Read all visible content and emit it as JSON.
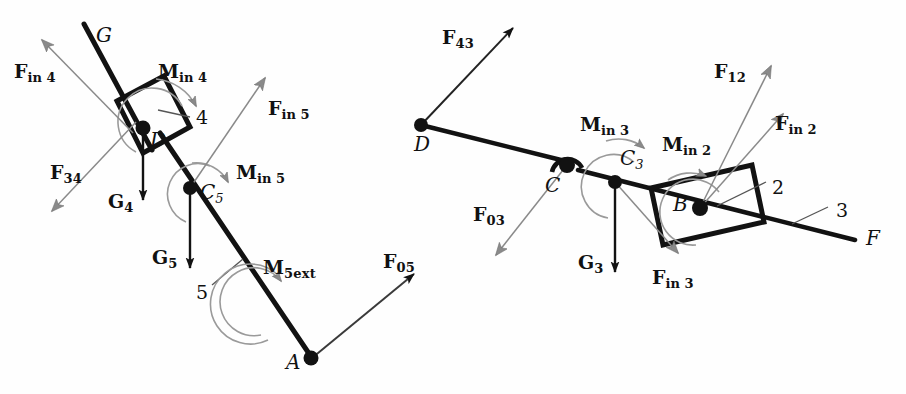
{
  "figure": {
    "type": "free-body-diagram",
    "canvas": {
      "width": 906,
      "height": 394
    },
    "colors": {
      "black": "#121212",
      "gray_arrow": "#878787",
      "thin_line": "#555555",
      "background": "#fefefe"
    }
  },
  "left_group": {
    "joints": [
      {
        "name": "D",
        "label": "D",
        "x": 143,
        "y": 128
      },
      {
        "name": "C5",
        "label": "C",
        "sub": "5",
        "x": 190,
        "y": 188
      },
      {
        "name": "A",
        "label": "A",
        "x": 310,
        "y": 358
      }
    ],
    "link_labels": [
      {
        "name": "link-4",
        "label": "4",
        "x": 196,
        "y": 111
      },
      {
        "name": "link-5",
        "label": "5",
        "x": 198,
        "y": 289
      },
      {
        "name": "axis-G",
        "label": "G",
        "x": 96,
        "y": 31
      }
    ],
    "vectors": [
      {
        "name": "F-in-4",
        "label": "F",
        "sub": "in 4",
        "color": "gray",
        "label_x": 14,
        "label_y": 62
      },
      {
        "name": "F-34",
        "label": "F",
        "sub": "34",
        "color": "gray",
        "label_x": 50,
        "label_y": 168
      },
      {
        "name": "G-4",
        "label": "G",
        "sub": "4",
        "color": "black",
        "label_x": 110,
        "label_y": 196
      },
      {
        "name": "G-5",
        "label": "G",
        "sub": "5",
        "color": "black",
        "label_x": 152,
        "label_y": 252
      },
      {
        "name": "F-in-5",
        "label": "F",
        "sub": "in 5",
        "color": "gray",
        "label_x": 268,
        "label_y": 106
      },
      {
        "name": "F-05",
        "label": "F",
        "sub": "05",
        "color": "black",
        "label_x": 383,
        "label_y": 256
      }
    ],
    "moments": [
      {
        "name": "M-in-4",
        "label": "M",
        "sub": "in 4",
        "color": "gray",
        "label_x": 158,
        "label_y": 62
      },
      {
        "name": "M-in-5",
        "label": "M",
        "sub": "in 5",
        "color": "gray",
        "label_x": 236,
        "label_y": 163
      },
      {
        "name": "M-5ext",
        "label": "M",
        "sub": "5ext",
        "color": "gray",
        "label_x": 263,
        "label_y": 262
      }
    ]
  },
  "right_group": {
    "joints": [
      {
        "name": "D-right",
        "label": "D",
        "x": 421,
        "y": 125
      },
      {
        "name": "C",
        "label": "C",
        "x": 567,
        "y": 165
      },
      {
        "name": "C3",
        "label": "C",
        "sub": "3",
        "x": 615,
        "y": 182
      },
      {
        "name": "B",
        "label": "B",
        "x": 700,
        "y": 208
      }
    ],
    "link_labels": [
      {
        "name": "link-2",
        "label": "2",
        "x": 772,
        "y": 185
      },
      {
        "name": "link-3",
        "label": "3",
        "x": 836,
        "y": 208
      },
      {
        "name": "axis-F",
        "label": "F",
        "x": 866,
        "y": 230
      }
    ],
    "vectors": [
      {
        "name": "F-43",
        "label": "F",
        "sub": "43",
        "color": "black",
        "label_x": 442,
        "label_y": 32
      },
      {
        "name": "F-03",
        "label": "F",
        "sub": "03",
        "color": "gray",
        "label_x": 473,
        "label_y": 209
      },
      {
        "name": "G-3",
        "label": "G",
        "sub": "3",
        "color": "black",
        "label_x": 581,
        "label_y": 257
      },
      {
        "name": "F-in-3",
        "label": "F",
        "sub": "in 3",
        "color": "gray",
        "label_x": 652,
        "label_y": 272
      },
      {
        "name": "F-12",
        "label": "F",
        "sub": "12",
        "color": "gray",
        "label_x": 714,
        "label_y": 66
      },
      {
        "name": "F-in-2",
        "label": "F",
        "sub": "in 2",
        "color": "gray",
        "label_x": 775,
        "label_y": 121
      }
    ],
    "moments": [
      {
        "name": "M-in-3",
        "label": "M",
        "sub": "in 3",
        "color": "gray",
        "label_x": 580,
        "label_y": 119
      },
      {
        "name": "M-in-2",
        "label": "M",
        "sub": "in 2",
        "color": "gray",
        "label_x": 662,
        "label_y": 139
      }
    ]
  }
}
